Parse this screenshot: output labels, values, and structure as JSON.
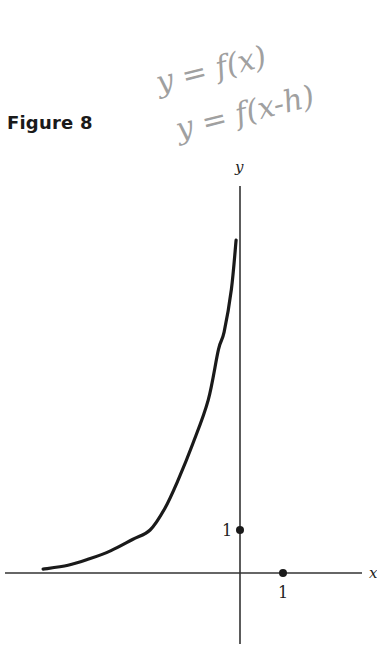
{
  "figure": {
    "title": "Figure 8"
  },
  "annotations": {
    "line1": "y = f(x)",
    "line2": "y = f(x-h)"
  },
  "chart_data": {
    "type": "line",
    "title": "Figure 8",
    "xlabel": "x",
    "ylabel": "y",
    "xlim": [
      -5.5,
      2.85
    ],
    "ylim": [
      -1.65,
      8.5
    ],
    "grid": false,
    "legend": null,
    "tick_labels": {
      "x": [
        "1"
      ],
      "y": [
        "1"
      ]
    },
    "marked_points": [
      {
        "x": 0,
        "y": 1,
        "label": "1"
      },
      {
        "x": 1,
        "y": 0,
        "label": "1"
      }
    ],
    "series": [
      {
        "name": "curve",
        "x": [
          -4.58,
          -4.0,
          -3.5,
          -3.0,
          -2.5,
          -2.09,
          -1.75,
          -1.44,
          -1.1,
          -0.74,
          -0.5,
          -0.37,
          -0.2,
          -0.09
        ],
        "y": [
          0.09,
          0.18,
          0.33,
          0.52,
          0.78,
          1.0,
          1.5,
          2.16,
          3.0,
          4.02,
          5.2,
          5.6,
          6.6,
          7.74
        ]
      }
    ],
    "annotations": [
      "y = f(x)",
      "y = f(x-h)"
    ]
  }
}
